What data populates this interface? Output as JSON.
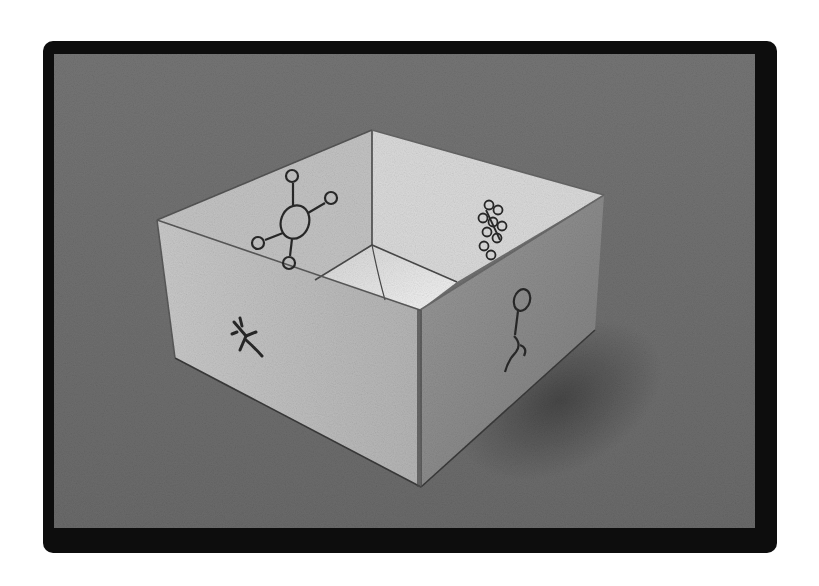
{
  "image": {
    "description": "Black-and-white photograph of an open folded paper box on a textured grey surface, with hand-drawn molecule-like symbols on its faces",
    "frame_color": "#0d0d0d",
    "background_color": "#7a7a7a",
    "paper_light": "#d8d8d8",
    "paper_mid": "#bdbdbd",
    "paper_dark": "#8f8f8f",
    "ink_color": "#2a2a2a"
  },
  "box": {
    "faces": [
      {
        "name": "left-outer-face",
        "symbol": "cross-squiggle-symbol"
      },
      {
        "name": "right-outer-face",
        "symbol": "loop-chain-symbol"
      },
      {
        "name": "back-left-inner-face",
        "symbol": "ring-with-four-branches-symbol"
      },
      {
        "name": "back-right-inner-face",
        "symbol": "stacked-rings-cluster-symbol"
      }
    ]
  }
}
